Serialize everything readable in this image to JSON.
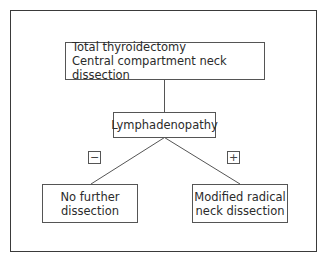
{
  "diagram": {
    "type": "flowchart",
    "nodes": {
      "root": {
        "line1": "Total thyroidectomy",
        "line2": "Central compartment neck dissection"
      },
      "decision": {
        "label": "Lymphadenopathy"
      },
      "negative": {
        "line1": "No further",
        "line2": "dissection"
      },
      "positive": {
        "line1": "Modified radical",
        "line2": "neck dissection"
      }
    },
    "edges": [
      {
        "from": "root",
        "to": "decision",
        "label": ""
      },
      {
        "from": "decision",
        "to": "negative",
        "label": "−"
      },
      {
        "from": "decision",
        "to": "positive",
        "label": "+"
      }
    ],
    "signs": {
      "minus": "−",
      "plus": "+"
    },
    "colors": {
      "line": "#555555",
      "frame": "#3a3a3a",
      "text": "#2b2b2b"
    }
  }
}
